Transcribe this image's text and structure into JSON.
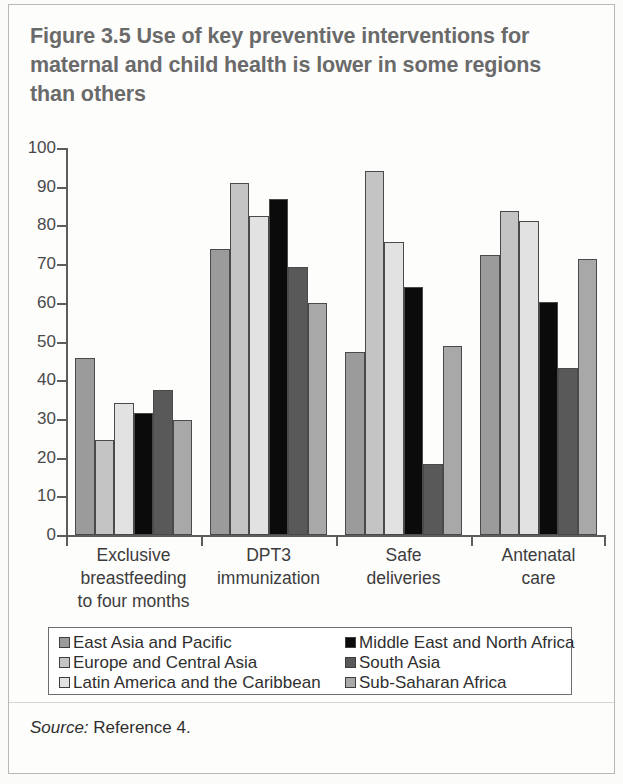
{
  "figure": {
    "title": "Figure 3.5  Use of key preventive interventions for maternal and child health is lower in some regions than others",
    "source_prefix": "Source:",
    "source_text": " Reference 4."
  },
  "legend": {
    "left_items": [
      {
        "label": "East Asia and Pacific",
        "color": "#9b9b9b"
      },
      {
        "label": "Europe and Central Asia",
        "color": "#c4c4c4"
      },
      {
        "label": "Latin America and the Caribbean",
        "color": "#e2e2e2"
      }
    ],
    "right_items": [
      {
        "label": "Middle East and North Africa",
        "color": "#0b0b0b"
      },
      {
        "label": "South Asia",
        "color": "#595959"
      },
      {
        "label": "Sub-Saharan Africa",
        "color": "#a8a8a8"
      }
    ]
  },
  "chart_data": {
    "type": "bar",
    "title": "Figure 3.5  Use of key preventive interventions for maternal and child health is lower in some regions than others",
    "xlabel": "",
    "ylabel": "",
    "ylim": [
      0,
      100
    ],
    "yticks": [
      0,
      10,
      20,
      30,
      40,
      50,
      60,
      70,
      80,
      90,
      100
    ],
    "grid": false,
    "legend_position": "bottom",
    "categories": [
      "Exclusive breastfeeding to four months",
      "DPT3 immunization",
      "Safe deliveries",
      "Antenatal care"
    ],
    "category_label_lines": [
      [
        "Exclusive",
        "breastfeeding",
        "to four months"
      ],
      [
        "DPT3",
        "immunization"
      ],
      [
        "Safe",
        "deliveries"
      ],
      [
        "Antenatal",
        "care"
      ]
    ],
    "series": [
      {
        "name": "East Asia and Pacific",
        "color": "#9b9b9b",
        "values": [
          45.7,
          74.0,
          47.2,
          72.3
        ]
      },
      {
        "name": "Europe and Central Asia",
        "color": "#c4c4c4",
        "values": [
          24.6,
          91.0,
          94.0,
          83.8
        ]
      },
      {
        "name": "Latin America and the Caribbean",
        "color": "#e2e2e2",
        "values": [
          34.2,
          82.4,
          75.8,
          81.2
        ]
      },
      {
        "name": "Middle East and North Africa",
        "color": "#0b0b0b",
        "values": [
          31.6,
          86.9,
          64.0,
          60.1
        ]
      },
      {
        "name": "South Asia",
        "color": "#595959",
        "values": [
          37.5,
          69.2,
          18.3,
          43.2
        ]
      },
      {
        "name": "Sub-Saharan Africa",
        "color": "#a8a8a8",
        "values": [
          29.6,
          59.9,
          48.9,
          71.4
        ]
      }
    ]
  }
}
